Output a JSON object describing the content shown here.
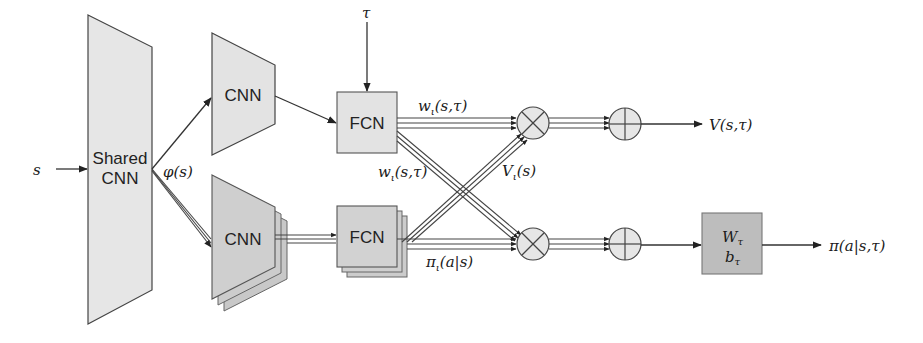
{
  "diagram": {
    "input": {
      "label": "s"
    },
    "shared_cnn": {
      "line1": "Shared",
      "line2": "CNN"
    },
    "features": {
      "label": "φ(s)"
    },
    "top_branch": {
      "cnn_label": "CNN",
      "fcn_label": "FCN",
      "task_input": "τ",
      "weights_label_top": "w",
      "weights_label_top_sub": "ι",
      "weights_label_top_args": "(s,τ)",
      "weights_label_cross": "w",
      "weights_label_cross_sub": "ι",
      "weights_label_cross_args": "(s,τ)"
    },
    "bottom_branch": {
      "cnn_label": "CNN",
      "fcn_label": "FCN",
      "value_label": "V",
      "value_label_sub": "ι",
      "value_label_args": "(s)",
      "policy_label": "π",
      "policy_label_sub": "ι",
      "policy_label_args": "(a|s)"
    },
    "operators": {
      "multiply_symbol": "⊗",
      "sum_symbol": "⊕"
    },
    "linear_layer": {
      "weight": "W",
      "weight_sub": "τ",
      "bias": "b",
      "bias_sub": "τ"
    },
    "outputs": {
      "value": "V(s,τ)",
      "policy": "π(a|s,τ)"
    },
    "colors": {
      "light_fill": "#e3e3e3",
      "mid_fill": "#cfcfcf",
      "dark_fill": "#b9b9b9",
      "stroke": "#333333",
      "background": "#ffffff"
    }
  }
}
